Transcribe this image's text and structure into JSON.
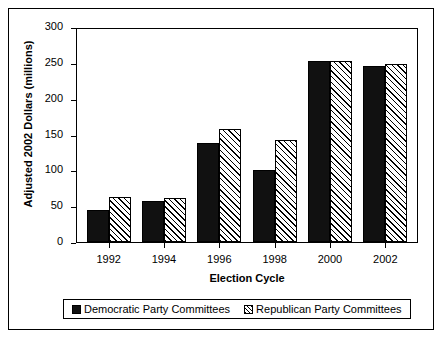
{
  "chart_data": {
    "type": "bar",
    "title": "",
    "xlabel": "Election Cycle",
    "ylabel": "Adjusted 2002 Dollars (millions)",
    "categories": [
      "1992",
      "1994",
      "1996",
      "1998",
      "2000",
      "2002"
    ],
    "ylim": [
      0,
      300
    ],
    "yticks": [
      0,
      50,
      100,
      150,
      200,
      250,
      300
    ],
    "grid": false,
    "legend_position": "bottom",
    "series": [
      {
        "name": "Democratic Party Committees",
        "swatch": "solid-black-square",
        "color": "#111111",
        "values": [
          45,
          57,
          138,
          100,
          252,
          245
        ]
      },
      {
        "name": "Republican Party Committees",
        "swatch": "hatched-square",
        "color": "#ffffff",
        "values": [
          63,
          62,
          158,
          142,
          253,
          248
        ]
      }
    ]
  },
  "axis": {
    "ytick_labels": [
      "300",
      "250",
      "200",
      "150",
      "100",
      "50",
      "0"
    ],
    "xtick_labels": [
      "1992",
      "1994",
      "1996",
      "1998",
      "2000",
      "2002"
    ],
    "xaxis_title": "Election Cycle",
    "yaxis_title": "Adjusted 2002 Dollars (millions)"
  },
  "legend": {
    "items": [
      {
        "label": "Democratic Party Committees"
      },
      {
        "label": "Republican Party Committees"
      }
    ]
  }
}
